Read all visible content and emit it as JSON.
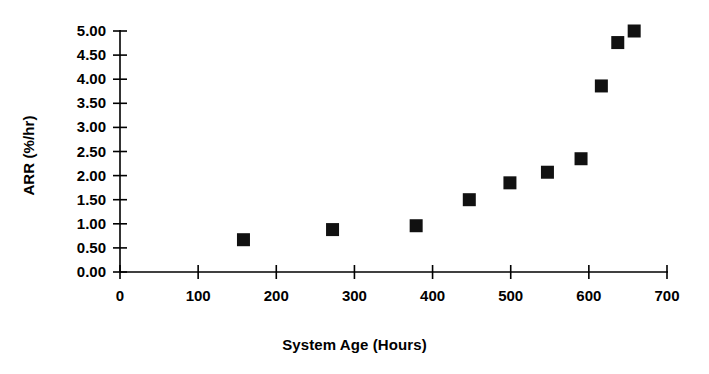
{
  "chart_data": {
    "type": "scatter",
    "title": "",
    "xlabel": "System Age (Hours)",
    "ylabel": "ARR (%/hr)",
    "xlim": [
      0,
      700
    ],
    "ylim": [
      0,
      5.0
    ],
    "xticks": [
      0,
      100,
      200,
      300,
      400,
      500,
      600,
      700
    ],
    "xtick_labels": [
      "0",
      "100",
      "200",
      "300",
      "400",
      "500",
      "600",
      "700"
    ],
    "yticks": [
      0.0,
      0.5,
      1.0,
      1.5,
      2.0,
      2.5,
      3.0,
      3.5,
      4.0,
      4.5,
      5.0
    ],
    "ytick_labels": [
      "0.00",
      "0.50",
      "1.00",
      "1.50",
      "2.00",
      "2.50",
      "3.00",
      "3.50",
      "4.00",
      "4.50",
      "5.00"
    ],
    "grid": false,
    "legend": false,
    "marker": "square",
    "marker_color": "#111111",
    "marker_size": 13,
    "series": [
      {
        "name": "ARR",
        "x": [
          158,
          272,
          379,
          447,
          499,
          547,
          590,
          616,
          637,
          658
        ],
        "y": [
          0.67,
          0.88,
          0.96,
          1.5,
          1.85,
          2.07,
          2.35,
          3.86,
          4.76,
          5.0
        ]
      }
    ]
  }
}
